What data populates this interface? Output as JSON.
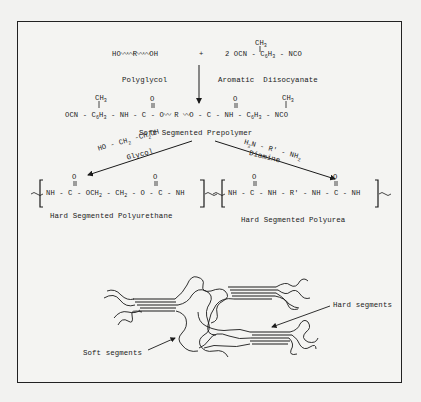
{
  "reaction": {
    "reactant1": {
      "formula": "HO ~~~ R ~~~ OH",
      "name": "Polyglycol"
    },
    "plus": "+",
    "reactant2": {
      "formula": "2 OCN - C6H3 - NCO",
      "substituent": "CH3",
      "name": "Aromatic  Diisocyanate"
    },
    "prepolymer": {
      "formula_left": "OCN - C6H3 - NH - C - O ~~ R ~~ O - C - NH - C6H3 - NCO",
      "substituent": "CH3",
      "carbonyl": "O",
      "name": "Soft Segmented Prepolymer"
    },
    "branch_glycol": {
      "reagent": "HO - CH2 -CH2OH",
      "reagent_name": "Glycol",
      "product_formula": "NH - C - OCH2 - CH2 - O - C - NH",
      "product_name": "Hard Segmented Polyurethane"
    },
    "branch_diamine": {
      "reagent": "H2N - R' - NH2",
      "reagent_name": "Diamine",
      "product_formula": "NH - C - NH - R' - NH - C - NH",
      "product_name": "Hard Segmented Polyurea"
    }
  },
  "morphology": {
    "label_hard": "Hard segments",
    "label_soft": "Soft segments"
  },
  "colors": {
    "ink": "#1a1a1a",
    "paper": "#f4f4f2"
  }
}
